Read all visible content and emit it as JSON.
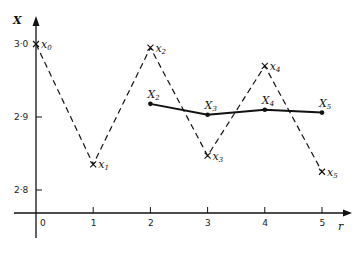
{
  "chart_data": {
    "type": "line",
    "title": "",
    "xlabel": "r",
    "ylabel": "X",
    "x_ticks": [
      "0",
      "1",
      "2",
      "3",
      "4",
      "5"
    ],
    "y_ticks": [
      "2·8",
      "2·9",
      "3·0"
    ],
    "ylim": [
      2.77,
      3.04
    ],
    "xlim": [
      -0.4,
      5.6
    ],
    "grid": false,
    "series": [
      {
        "name": "x_r",
        "style": "dashed",
        "marker": "cross",
        "x": [
          0,
          1,
          2,
          3,
          4,
          5
        ],
        "values": [
          3.0,
          2.835,
          2.995,
          2.847,
          2.97,
          2.825
        ],
        "labels": [
          "x0",
          "x1",
          "x2",
          "x3",
          "x4",
          "x5"
        ]
      },
      {
        "name": "X_r",
        "style": "solid",
        "marker": "dot",
        "x": [
          2,
          3,
          4,
          5
        ],
        "values": [
          2.918,
          2.903,
          2.91,
          2.906
        ],
        "labels": [
          "X2",
          "X3",
          "X4",
          "X5"
        ]
      }
    ]
  }
}
